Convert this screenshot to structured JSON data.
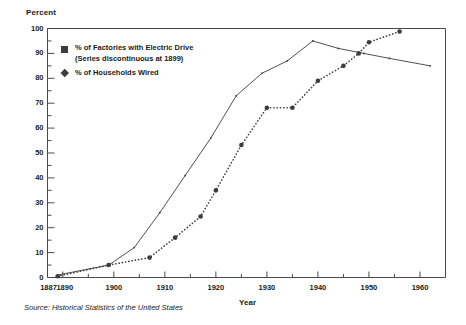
{
  "chart_data": {
    "type": "line",
    "title": "",
    "ylabel": "Percent",
    "xlabel": "Year",
    "source": "Source: Historical Statistics of the United States",
    "xlim": [
      1887,
      1965
    ],
    "ylim": [
      0,
      100
    ],
    "grid": false,
    "legend_position": "top-left",
    "y_ticks_major": [
      0,
      10,
      20,
      30,
      40,
      50,
      60,
      70,
      80,
      90,
      100
    ],
    "y_ticks_minor": [
      5,
      15,
      25,
      35,
      45,
      55,
      65,
      75,
      85,
      95
    ],
    "x_ticks_major": [
      1890,
      1900,
      1910,
      1920,
      1930,
      1940,
      1950,
      1960
    ],
    "x_ticks_minor": [
      1895,
      1905,
      1915,
      1925,
      1935,
      1945,
      1955
    ],
    "x_tick_labels": [
      "1887",
      "1890",
      "1900",
      "1910",
      "1920",
      "1930",
      "1940",
      "1950",
      "1960"
    ],
    "y_tick_labels": [
      "100",
      "90",
      "80",
      "70",
      "60",
      "50",
      "40",
      "30",
      "20",
      "10",
      "0"
    ],
    "series": [
      {
        "name": "% of Factories with Electric Drive",
        "note": "(Series discontinuous at 1899)",
        "style": "solid",
        "marker": "square",
        "color": "#3c3c3c",
        "x": [
          1889,
          1899,
          1904,
          1909,
          1914,
          1919,
          1924,
          1929,
          1934,
          1939,
          1944,
          1949,
          1954,
          1962
        ],
        "y": [
          1,
          5,
          12,
          26,
          41,
          56,
          73,
          82,
          87,
          95,
          92,
          90,
          88,
          85
        ]
      },
      {
        "name": "% of Households Wired",
        "style": "dotted",
        "marker": "diamond",
        "color": "#3c3c3c",
        "x": [
          1889,
          1899,
          1907,
          1912,
          1917,
          1920,
          1925,
          1930,
          1935,
          1940,
          1945,
          1948,
          1950,
          1956
        ],
        "y": [
          0.5,
          5,
          8,
          16,
          24.5,
          35,
          53.2,
          68.2,
          68.2,
          79,
          85,
          90,
          94.5,
          98.8
        ]
      }
    ]
  },
  "labels": {
    "y_axis_title": "Percent",
    "x_axis_title": "Year",
    "source": "Source: Historical Statistics of the United States",
    "legend": {
      "item1_line1": "% of Factories with Electric Drive",
      "item1_line2": "(Series discontinuous at 1899)",
      "item2": "% of Households Wired"
    }
  },
  "colors": {
    "axis": "#4a4a4a",
    "series": "#3c3c3c",
    "text": "#1a1a1a",
    "background": "#ffffff"
  }
}
